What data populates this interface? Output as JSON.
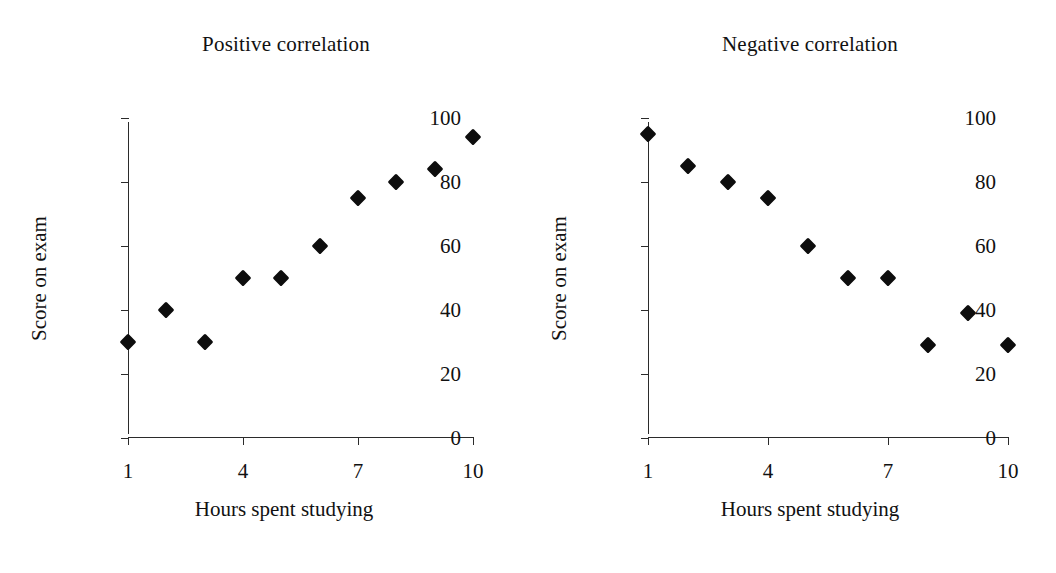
{
  "figure": {
    "background": "#ffffff",
    "marker_color": "#0d0d0d",
    "axis_color": "#2b2b2b"
  },
  "chart_data": [
    {
      "type": "scatter",
      "title": "Positive correlation",
      "xlabel": "Hours spent studying",
      "ylabel": "Score on exam",
      "xlim": [
        1,
        10
      ],
      "ylim": [
        0,
        100
      ],
      "xticks": [
        1,
        4,
        7,
        10
      ],
      "xtick_labels": [
        "1",
        "4",
        "7",
        "10"
      ],
      "yticks": [
        0,
        20,
        40,
        60,
        80,
        100
      ],
      "ytick_labels": [
        "0",
        "20",
        "40",
        "60",
        "80",
        "100"
      ],
      "grid": false,
      "legend": "none",
      "marker": "diamond",
      "x": [
        1,
        2,
        3,
        4,
        5,
        6,
        7,
        8,
        9,
        10
      ],
      "values": [
        30,
        40,
        30,
        50,
        50,
        60,
        75,
        80,
        84,
        94
      ],
      "points": [
        {
          "x": 1,
          "y": 30
        },
        {
          "x": 2,
          "y": 40
        },
        {
          "x": 3,
          "y": 30
        },
        {
          "x": 4,
          "y": 50
        },
        {
          "x": 5,
          "y": 50
        },
        {
          "x": 6,
          "y": 60
        },
        {
          "x": 7,
          "y": 75
        },
        {
          "x": 8,
          "y": 80
        },
        {
          "x": 9,
          "y": 84
        },
        {
          "x": 10,
          "y": 94
        }
      ]
    },
    {
      "type": "scatter",
      "title": "Negative correlation",
      "xlabel": "Hours spent studying",
      "ylabel": "Score on exam",
      "xlim": [
        1,
        10
      ],
      "ylim": [
        0,
        100
      ],
      "xticks": [
        1,
        4,
        7,
        10
      ],
      "xtick_labels": [
        "1",
        "4",
        "7",
        "10"
      ],
      "yticks": [
        0,
        20,
        40,
        60,
        80,
        100
      ],
      "ytick_labels": [
        "0",
        "20",
        "40",
        "60",
        "80",
        "100"
      ],
      "grid": false,
      "legend": "none",
      "marker": "diamond",
      "x": [
        1,
        2,
        3,
        4,
        5,
        6,
        7,
        8,
        9,
        10
      ],
      "values": [
        95,
        85,
        80,
        75,
        60,
        50,
        50,
        29,
        39,
        29
      ],
      "points": [
        {
          "x": 1,
          "y": 95
        },
        {
          "x": 2,
          "y": 85
        },
        {
          "x": 3,
          "y": 80
        },
        {
          "x": 4,
          "y": 75
        },
        {
          "x": 5,
          "y": 60
        },
        {
          "x": 6,
          "y": 50
        },
        {
          "x": 7,
          "y": 50
        },
        {
          "x": 8,
          "y": 29
        },
        {
          "x": 9,
          "y": 39
        },
        {
          "x": 10,
          "y": 29
        }
      ]
    }
  ]
}
